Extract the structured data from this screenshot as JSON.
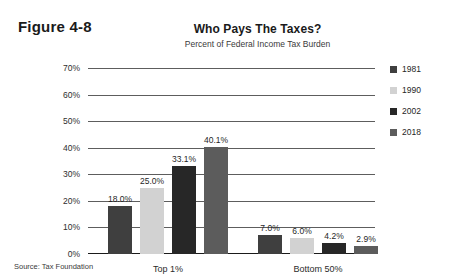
{
  "figure_label": "Figure 4-8",
  "source_note": "Source: Tax Foundation",
  "chart_data": {
    "type": "bar",
    "title": "Who Pays The Taxes?",
    "subtitle": "Percent of Federal Income Tax Burden",
    "xlabel": "",
    "ylabel": "",
    "ylim": [
      0,
      70
    ],
    "ytick_labels": [
      "70%",
      "60%",
      "50%",
      "40%",
      "30%",
      "20%",
      "10%",
      "0%"
    ],
    "ytick_values": [
      70,
      60,
      50,
      40,
      30,
      20,
      10,
      0
    ],
    "grid": true,
    "legend_position": "right",
    "categories": [
      "Top 1%",
      "Bottom 50%"
    ],
    "series": [
      {
        "name": "1981",
        "color": "#3f3f3f",
        "values": [
          18.0,
          7.0
        ],
        "labels": [
          "18.0%",
          "7.0%"
        ]
      },
      {
        "name": "1990",
        "color": "#d2d2d2",
        "values": [
          25.0,
          6.0
        ],
        "labels": [
          "25.0%",
          "6.0%"
        ]
      },
      {
        "name": "2002",
        "color": "#272727",
        "values": [
          33.1,
          4.2
        ],
        "labels": [
          "33.1%",
          "4.2%"
        ]
      },
      {
        "name": "2018",
        "color": "#5c5c5c",
        "values": [
          40.1,
          2.9
        ],
        "labels": [
          "40.1%",
          "2.9%"
        ]
      }
    ]
  }
}
